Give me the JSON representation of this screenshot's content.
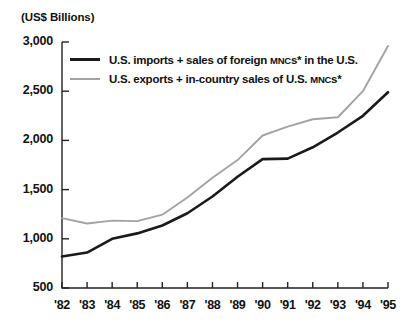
{
  "axis_title": "(US$ Billions)",
  "legend": [
    {
      "swatch": "dark",
      "label_before": "U.S. imports + sales of foreign ",
      "label_sc": "MNC",
      "label_after": "s* in the U.S."
    },
    {
      "swatch": "light",
      "label_before": "U.S. exports + in-country sales of U.S. ",
      "label_sc": "MNC",
      "label_after": "s*"
    }
  ],
  "colors": {
    "background": "#ffffff",
    "axis": "#222222",
    "series_imports": "#1a1a1a",
    "series_exports": "#a3a3a3",
    "text": "#111111"
  },
  "chart_data": {
    "type": "line",
    "title": "",
    "subtitle": "",
    "xlabel": "",
    "ylabel": "(US$ Billions)",
    "x": [
      "'82",
      "'83",
      "'84",
      "'85",
      "'86",
      "'87",
      "'88",
      "'89",
      "'90",
      "'91",
      "'92",
      "'93",
      "'94",
      "'95"
    ],
    "xtick_labels": [
      "'82",
      "'83",
      "'84",
      "'85",
      "'86",
      "'87",
      "'88",
      "'89",
      "'90",
      "'91",
      "'92",
      "'93",
      "'94",
      "'95"
    ],
    "ytick_labels": [
      "3,000",
      "2,500",
      "2,000",
      "1,500",
      "1,000",
      "500"
    ],
    "ytick_values": [
      3000,
      2500,
      2000,
      1500,
      1000,
      500
    ],
    "ylim": [
      500,
      3000
    ],
    "grid": false,
    "legend_position": "upper-left-inside",
    "annotations": [
      "*"
    ],
    "series": [
      {
        "name": "U.S. imports + sales of foreign MNCs* in the U.S.",
        "color": "#1a1a1a",
        "values": [
          820,
          860,
          1000,
          1055,
          1135,
          1260,
          1430,
          1630,
          1810,
          1815,
          1930,
          2080,
          2250,
          2490
        ]
      },
      {
        "name": "U.S. exports + in-country sales of U.S. MNCs*",
        "color": "#a3a3a3",
        "values": [
          1210,
          1155,
          1185,
          1180,
          1245,
          1420,
          1620,
          1800,
          2050,
          2140,
          2215,
          2235,
          2500,
          2960
        ]
      }
    ]
  }
}
